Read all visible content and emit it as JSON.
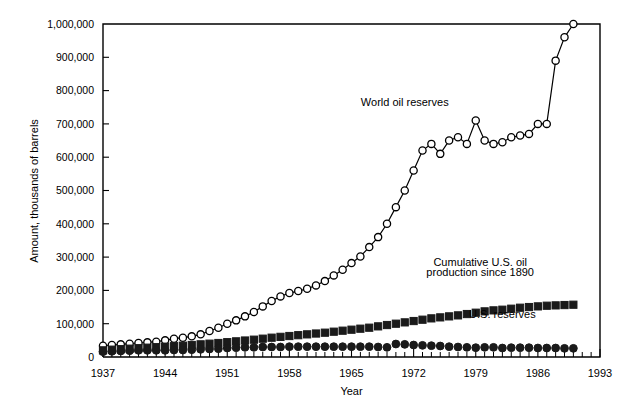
{
  "chart_data": {
    "type": "line",
    "title": "",
    "xlabel": "Year",
    "ylabel": "Amount, thousands of barrels",
    "xlim": [
      1937,
      1993
    ],
    "ylim": [
      0,
      1000000
    ],
    "grid": false,
    "legend_position": "inline-annotations",
    "x_tick_labels": [
      "1937",
      "1944",
      "1951",
      "1958",
      "1965",
      "1972",
      "1979",
      "1986",
      "1993"
    ],
    "x_tick_values": [
      1937,
      1944,
      1951,
      1958,
      1965,
      1972,
      1979,
      1986,
      1993
    ],
    "x_minor_tick_interval": 1,
    "y_tick_labels": [
      "0",
      "100,000",
      "200,000",
      "300,000",
      "400,000",
      "500,000",
      "600,000",
      "700,000",
      "800,000",
      "900,000",
      "1,000,000"
    ],
    "y_tick_values": [
      0,
      100000,
      200000,
      300000,
      400000,
      500000,
      600000,
      700000,
      800000,
      900000,
      1000000
    ],
    "annotations": [
      {
        "text": "World oil reserves",
        "x": 1971,
        "y": 755000
      },
      {
        "text": "Cumulative U.S. oil",
        "x": 1979.5,
        "y": 272000
      },
      {
        "text": "production since 1890",
        "x": 1979.5,
        "y": 242000
      },
      {
        "text": "U.S. reserves",
        "x": 1982,
        "y": 117000
      }
    ],
    "series": [
      {
        "name": "World oil reserves",
        "marker": "open-circle",
        "color": "#000000",
        "x": [
          1937,
          1938,
          1939,
          1940,
          1941,
          1942,
          1943,
          1944,
          1945,
          1946,
          1947,
          1948,
          1949,
          1950,
          1951,
          1952,
          1953,
          1954,
          1955,
          1956,
          1957,
          1958,
          1959,
          1960,
          1961,
          1962,
          1963,
          1964,
          1965,
          1966,
          1967,
          1968,
          1969,
          1970,
          1971,
          1972,
          1973,
          1974,
          1975,
          1976,
          1977,
          1978,
          1979,
          1980,
          1981,
          1982,
          1983,
          1984,
          1985,
          1986,
          1987,
          1988,
          1989,
          1990
        ],
        "values": [
          34000,
          36000,
          38000,
          40000,
          42000,
          44000,
          46000,
          50000,
          55000,
          58000,
          62000,
          68000,
          78000,
          88000,
          100000,
          110000,
          122000,
          135000,
          152000,
          168000,
          182000,
          192000,
          198000,
          205000,
          215000,
          228000,
          245000,
          262000,
          282000,
          302000,
          330000,
          360000,
          400000,
          450000,
          500000,
          560000,
          620000,
          640000,
          610000,
          650000,
          660000,
          640000,
          710000,
          650000,
          640000,
          645000,
          660000,
          665000,
          670000,
          700000,
          700000,
          890000,
          960000,
          1000000
        ]
      },
      {
        "name": "Cumulative U.S. oil production since 1890",
        "marker": "filled-square",
        "color": "#1a1a1a",
        "x": [
          1937,
          1938,
          1939,
          1940,
          1941,
          1942,
          1943,
          1944,
          1945,
          1946,
          1947,
          1948,
          1949,
          1950,
          1951,
          1952,
          1953,
          1954,
          1955,
          1956,
          1957,
          1958,
          1959,
          1960,
          1961,
          1962,
          1963,
          1964,
          1965,
          1966,
          1967,
          1968,
          1969,
          1970,
          1971,
          1972,
          1973,
          1974,
          1975,
          1976,
          1977,
          1978,
          1979,
          1980,
          1981,
          1982,
          1983,
          1984,
          1985,
          1986,
          1987,
          1988,
          1989,
          1990
        ],
        "values": [
          20000,
          22000,
          23500,
          25000,
          26500,
          28000,
          29500,
          31000,
          32500,
          34000,
          36000,
          38000,
          40000,
          42000,
          44500,
          47000,
          49500,
          52000,
          55000,
          58000,
          60500,
          63000,
          65500,
          68000,
          70500,
          73000,
          76000,
          79000,
          82000,
          85000,
          88000,
          92000,
          96000,
          100000,
          104000,
          108000,
          112000,
          116000,
          119000,
          122000,
          125000,
          129000,
          133000,
          137000,
          140000,
          142000,
          145000,
          148000,
          150000,
          152000,
          154000,
          155000,
          156000,
          157000
        ]
      },
      {
        "name": "U.S. reserves",
        "marker": "filled-circle",
        "color": "#1a1a1a",
        "x": [
          1937,
          1938,
          1939,
          1940,
          1941,
          1942,
          1943,
          1944,
          1945,
          1946,
          1947,
          1948,
          1949,
          1950,
          1951,
          1952,
          1953,
          1954,
          1955,
          1956,
          1957,
          1958,
          1959,
          1960,
          1961,
          1962,
          1963,
          1964,
          1965,
          1966,
          1967,
          1968,
          1969,
          1970,
          1971,
          1972,
          1973,
          1974,
          1975,
          1976,
          1977,
          1978,
          1979,
          1980,
          1981,
          1982,
          1983,
          1984,
          1985,
          1986,
          1987,
          1988,
          1989,
          1990
        ],
        "values": [
          16000,
          17000,
          18000,
          19000,
          20000,
          20000,
          20000,
          20000,
          21000,
          21000,
          22000,
          23000,
          24000,
          25000,
          27000,
          28000,
          29000,
          29000,
          30000,
          30000,
          30000,
          31000,
          31000,
          31000,
          31000,
          31000,
          31000,
          31000,
          31000,
          31000,
          31000,
          30000,
          29000,
          39000,
          38000,
          36000,
          35000,
          34000,
          33000,
          31000,
          30000,
          29000,
          28000,
          29000,
          29000,
          27000,
          28000,
          28000,
          28000,
          27000,
          27000,
          27000,
          26000,
          26000
        ]
      }
    ]
  }
}
